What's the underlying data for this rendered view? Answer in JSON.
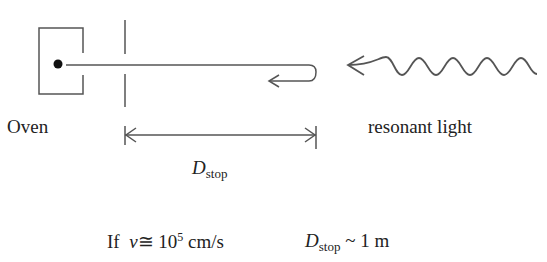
{
  "labels": {
    "oven": "Oven",
    "light": "resonant light",
    "dstop_symbol": "D",
    "dstop_sub": "stop"
  },
  "condition": {
    "if": "If",
    "velocity_symbol": "v",
    "approx": "≅",
    "base": "10",
    "exponent": "5",
    "unit": "cm/s",
    "dstop_symbol": "D",
    "dstop_sub": "stop",
    "tilde": "~",
    "result": "1 m"
  },
  "colors": {
    "stroke": "#555555",
    "text": "#222222"
  }
}
